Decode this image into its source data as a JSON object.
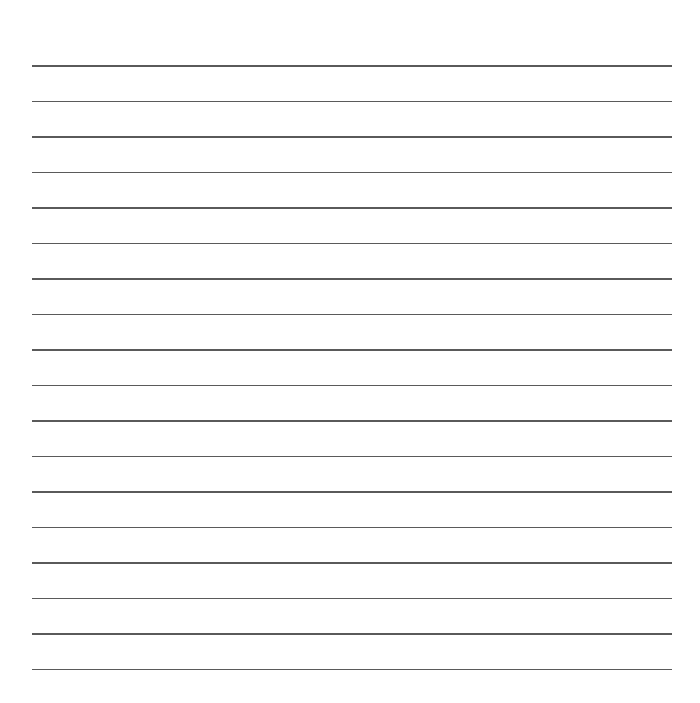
{
  "document": {
    "type": "lined-paper",
    "background_color": "#ffffff",
    "line_color": "#5a5a5a",
    "line_count": 18,
    "line_left_px": 32,
    "line_right_px": 672,
    "first_line_y_px": 66,
    "line_spacing_px": 35.5,
    "lines": [
      {
        "y": 66
      },
      {
        "y": 101.5
      },
      {
        "y": 137
      },
      {
        "y": 172.5
      },
      {
        "y": 208
      },
      {
        "y": 243.5
      },
      {
        "y": 279
      },
      {
        "y": 314.5
      },
      {
        "y": 350
      },
      {
        "y": 385.5
      },
      {
        "y": 421
      },
      {
        "y": 456.5
      },
      {
        "y": 492
      },
      {
        "y": 527.5
      },
      {
        "y": 563
      },
      {
        "y": 598.5
      },
      {
        "y": 634
      },
      {
        "y": 669.5
      }
    ]
  }
}
